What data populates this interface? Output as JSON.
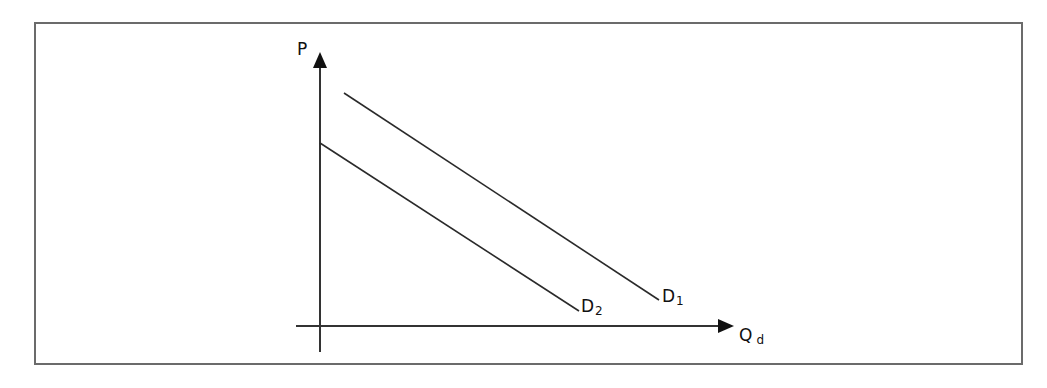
{
  "diagram": {
    "type": "demand-shift",
    "y_axis_label": "P",
    "x_axis_label": "Q",
    "x_axis_label_sub": "d",
    "curves": [
      {
        "name": "D",
        "sub": "1",
        "x1": 344,
        "y1": 93,
        "x2": 659,
        "y2": 300
      },
      {
        "name": "D",
        "sub": "2",
        "x1": 320,
        "y1": 143,
        "x2": 579,
        "y2": 311
      }
    ],
    "line_color": "#2a2a2a",
    "frame_color": "#6b6b6b"
  }
}
